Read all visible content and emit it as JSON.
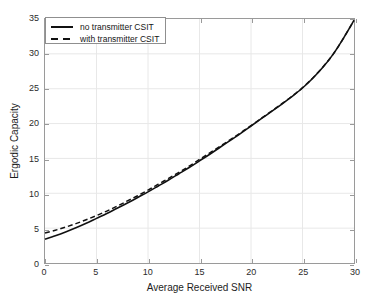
{
  "chart_data": {
    "type": "line",
    "title": "",
    "xlabel": "Average Received SNR",
    "ylabel": "Ergodic Capacity",
    "xlim": [
      0,
      30
    ],
    "ylim": [
      0,
      35
    ],
    "xticks": [
      0,
      5,
      10,
      15,
      20,
      25,
      30
    ],
    "yticks": [
      0,
      5,
      10,
      15,
      20,
      25,
      30,
      35
    ],
    "grid": true,
    "legend_position": "upper left",
    "series": [
      {
        "name": "no transmitter CSIT",
        "style": "solid",
        "color": "#111111",
        "x": [
          0,
          1,
          2,
          3,
          4,
          5,
          6,
          7,
          8,
          9,
          10,
          11,
          12,
          13,
          14,
          15,
          16,
          17,
          18,
          19,
          20,
          21,
          22,
          23,
          24,
          25,
          26,
          27,
          28,
          29,
          30
        ],
        "y": [
          3.4,
          3.9,
          4.45,
          5.05,
          5.7,
          6.4,
          7.1,
          7.85,
          8.6,
          9.4,
          10.2,
          11.05,
          11.9,
          12.8,
          13.7,
          14.65,
          15.6,
          16.6,
          17.6,
          18.6,
          19.65,
          20.7,
          21.75,
          22.8,
          23.9,
          25.1,
          26.5,
          28.1,
          30.0,
          32.3,
          34.8
        ]
      },
      {
        "name": "with transmitter CSIT",
        "style": "dashed",
        "color": "#111111",
        "x": [
          0,
          1,
          2,
          3,
          4,
          5,
          6,
          7,
          8,
          9,
          10,
          11,
          12,
          13,
          14,
          15,
          16,
          17,
          18,
          19,
          20,
          21,
          22,
          23,
          24,
          25,
          26,
          27,
          28,
          29,
          30
        ],
        "y": [
          4.3,
          4.7,
          5.15,
          5.65,
          6.2,
          6.8,
          7.45,
          8.15,
          8.9,
          9.65,
          10.45,
          11.3,
          12.15,
          13.0,
          13.9,
          14.85,
          15.8,
          16.75,
          17.7,
          18.7,
          19.7,
          20.75,
          21.8,
          22.85,
          23.95,
          25.15,
          26.55,
          28.15,
          30.0,
          32.3,
          34.8
        ]
      }
    ]
  },
  "legend": {
    "entries": [
      {
        "label": "no transmitter CSIT",
        "style": "solid"
      },
      {
        "label": "with transmitter CSIT",
        "style": "dashed"
      }
    ]
  },
  "colors": {
    "line": "#111111",
    "frame": "#9a9a9a",
    "grid": "#e8e8e8",
    "text": "#1d1d1d",
    "background": "#ffffff"
  }
}
